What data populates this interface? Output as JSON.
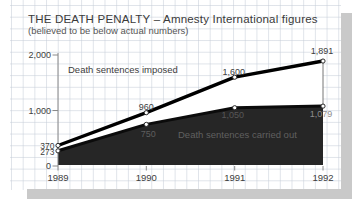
{
  "header": {
    "title": "THE DEATH PENALTY – Amnesty International figures",
    "subtitle": "(believed to be below actual numbers)"
  },
  "series_labels": {
    "imposed": "Death sentences imposed",
    "carried_out": "Death sentences carried out"
  },
  "chart_data": {
    "type": "area",
    "categories": [
      "1989",
      "1990",
      "1991",
      "1992"
    ],
    "series": [
      {
        "name": "Death sentences imposed",
        "values": [
          370,
          960,
          1600,
          1891
        ],
        "point_labels": [
          "370",
          "960",
          "1,600",
          "1,891"
        ]
      },
      {
        "name": "Death sentences carried out",
        "values": [
          273,
          750,
          1050,
          1079
        ],
        "point_labels": [
          "273",
          "750",
          "1,050",
          "1,079"
        ]
      }
    ],
    "ylim": [
      0,
      2000
    ],
    "yticks": [
      {
        "value": 0,
        "label": "0"
      },
      {
        "value": 1000,
        "label": "1,000"
      },
      {
        "value": 2000,
        "label": "2,000"
      }
    ],
    "grid": true,
    "legend_position": "inline-on-chart",
    "colors": {
      "imposed_line": "#000000",
      "carried_line": "#0b0b0b",
      "carried_area": "#262626",
      "band_fill": "#ffffff",
      "marker_fill": "#ffffff",
      "marker_ring": "#2b2b2b",
      "axis": "#8a8a8a",
      "label_text": "#3d3d3d",
      "dark_label_text": "#5e5e5e",
      "faint_label_text": "#8e8e8e",
      "shadow": "#c9c9c9"
    }
  }
}
